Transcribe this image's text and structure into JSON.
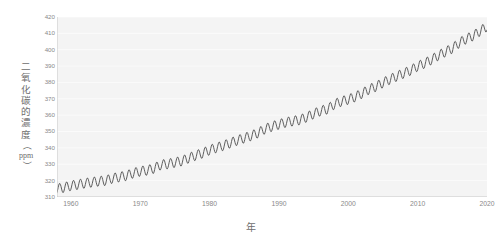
{
  "chart_data": {
    "type": "line",
    "title": "",
    "subtitle": "",
    "xlabel": "年",
    "ylabel": "二氧化碳的濃度（ppm）",
    "ylabel_chars": [
      "二",
      "氧",
      "化",
      "碳",
      "的",
      "濃",
      "度"
    ],
    "ylabel_unit": "ppm",
    "ylabel_paren_open": "（",
    "ylabel_paren_close": "）",
    "xlim": [
      1958,
      2020
    ],
    "ylim": [
      310,
      420
    ],
    "xticks": [
      1960,
      1970,
      1980,
      1990,
      2000,
      2010,
      2020
    ],
    "xtick_labels": [
      "1960",
      "1970",
      "1980",
      "1990",
      "2000",
      "2010",
      "2020"
    ],
    "yticks": [
      310,
      320,
      330,
      340,
      350,
      360,
      370,
      380,
      390,
      400,
      410,
      420
    ],
    "ytick_labels": [
      "310",
      "320",
      "330",
      "340",
      "350",
      "360",
      "370",
      "380",
      "390",
      "400",
      "410",
      "420"
    ],
    "grid": true,
    "grid_axis": "y",
    "legend": false,
    "legend_position": "none",
    "series": [
      {
        "name": "大氣二氧化碳濃度",
        "color": "#4d4d4d",
        "line_width": 0.9,
        "description": "Keeling curve: annual mean rises with superimposed seasonal sawtooth oscillation of about 6 ppm peak-to-trough",
        "seasonal_amplitude_ppm": 3.0,
        "annual_mean": {
          "x": [
            1958,
            1959,
            1960,
            1961,
            1962,
            1963,
            1964,
            1965,
            1966,
            1967,
            1968,
            1969,
            1970,
            1971,
            1972,
            1973,
            1974,
            1975,
            1976,
            1977,
            1978,
            1979,
            1980,
            1981,
            1982,
            1983,
            1984,
            1985,
            1986,
            1987,
            1988,
            1989,
            1990,
            1991,
            1992,
            1993,
            1994,
            1995,
            1996,
            1997,
            1998,
            1999,
            2000,
            2001,
            2002,
            2003,
            2004,
            2005,
            2006,
            2007,
            2008,
            2009,
            2010,
            2011,
            2012,
            2013,
            2014,
            2015,
            2016,
            2017,
            2018,
            2019,
            2020
          ],
          "y": [
            315.0,
            315.8,
            316.9,
            317.6,
            318.4,
            319.0,
            319.6,
            320.0,
            321.4,
            322.2,
            323.0,
            324.6,
            325.7,
            326.3,
            327.5,
            329.7,
            330.2,
            331.1,
            332.0,
            333.8,
            335.4,
            336.8,
            338.7,
            340.1,
            341.4,
            343.0,
            344.6,
            346.0,
            347.4,
            349.2,
            351.6,
            353.1,
            354.4,
            355.6,
            356.4,
            357.1,
            358.8,
            360.8,
            362.6,
            363.7,
            366.7,
            368.4,
            369.6,
            371.2,
            373.3,
            375.8,
            377.5,
            379.8,
            381.9,
            383.8,
            385.6,
            387.4,
            389.9,
            391.7,
            393.9,
            396.5,
            398.7,
            400.8,
            404.2,
            406.6,
            408.5,
            411.4,
            414.2
          ]
        }
      }
    ]
  },
  "colors": {
    "line": "#4d4d4d",
    "plot_background": "#f4f4f4",
    "gridline": "#fcfcfc",
    "axis": "#c8c8c8",
    "tick_text": "#8a8a8a",
    "axis_title_text": "#6d6d6d",
    "page_background": "#ffffff"
  }
}
